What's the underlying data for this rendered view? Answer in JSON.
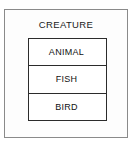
{
  "diagram": {
    "type": "classification-hierarchy",
    "outer": {
      "label": "CREATURE",
      "border_color": "#8a8a8a",
      "background": "#fdfdfd"
    },
    "inner": {
      "border_color": "#2b2b2b",
      "background": "#ffffff",
      "rows": [
        {
          "label": "ANIMAL"
        },
        {
          "label": "FISH"
        },
        {
          "label": "BIRD"
        }
      ]
    },
    "text_color": "#111111",
    "page_background": "#ffffff"
  }
}
